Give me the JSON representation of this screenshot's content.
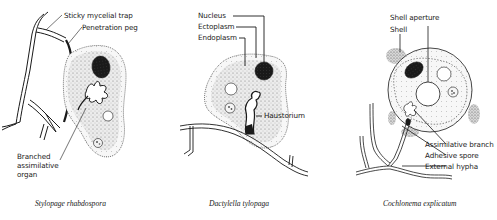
{
  "figure": {
    "panels": [
      {
        "id": "stylopage",
        "caption": "Stylopage rhabdospora",
        "labels": {
          "trap": "Sticky mycelial trap",
          "peg": "Penetration peg",
          "organ_line1": "Branched",
          "organ_line2": "assimilative",
          "organ_line3": "organ"
        }
      },
      {
        "id": "dactylella",
        "caption": "Dactylella tylopaga",
        "labels": {
          "nucleus": "Nucleus",
          "ectoplasm": "Ectoplasm",
          "endoplasm": "Endoplasm",
          "haustorium": "Haustorium"
        }
      },
      {
        "id": "cochlonema",
        "caption": "Cochlonema explicatum",
        "labels": {
          "aperture": "Shell aperture",
          "shell": "Shell",
          "branch": "Assimilative branch",
          "spore": "Adhesive spore",
          "hypha": "External hypha"
        }
      }
    ],
    "colors": {
      "ink": "#1a1a1a",
      "stipple": "#cfcfcf",
      "nucleus": "#1a1a1a",
      "background": "#ffffff"
    }
  }
}
